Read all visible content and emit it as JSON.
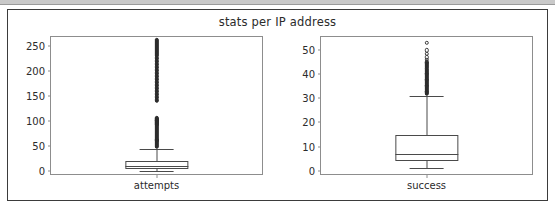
{
  "figure": {
    "title": "stats per IP address",
    "background": "#ffffff",
    "frame_color": "#3b3b3b",
    "axis_color": "#8d8d8d",
    "artist_color": "#4a4a4a"
  },
  "chart_data": [
    {
      "type": "box",
      "name": "attempts",
      "title": "stats per IP address",
      "xlabel": "",
      "ylabel": "",
      "categories": [
        "attempts"
      ],
      "xticklabels": [
        "attempts"
      ],
      "yticks": [
        0,
        50,
        100,
        150,
        200,
        250
      ],
      "yticklabels": [
        "0",
        "50",
        "100",
        "150",
        "200",
        "250"
      ],
      "ylim": [
        -6,
        268
      ],
      "grid": false,
      "legend": null,
      "stats": {
        "whisker_low": 1,
        "q1": 5,
        "median": 10,
        "q3": 20,
        "whisker_high": 45
      },
      "fliers": [
        48,
        50,
        52,
        55,
        57,
        58,
        60,
        61,
        62,
        63,
        65,
        66,
        68,
        70,
        72,
        74,
        76,
        78,
        80,
        82,
        84,
        86,
        88,
        90,
        92,
        93,
        94,
        95,
        96,
        97,
        98,
        99,
        100,
        100,
        101,
        102,
        103,
        104,
        105,
        106,
        140,
        143,
        146,
        149,
        152,
        155,
        158,
        161,
        164,
        167,
        170,
        173,
        176,
        179,
        182,
        185,
        188,
        191,
        194,
        197,
        200,
        203,
        206,
        209,
        212,
        215,
        218,
        221,
        224,
        227,
        230,
        232,
        234,
        236,
        238,
        240,
        242,
        244,
        246,
        248,
        250,
        252,
        254,
        256,
        258,
        260,
        262
      ]
    },
    {
      "type": "box",
      "name": "success",
      "title": "stats per IP address",
      "xlabel": "",
      "ylabel": "",
      "categories": [
        "success"
      ],
      "xticklabels": [
        "success"
      ],
      "yticks": [
        0,
        10,
        20,
        30,
        40,
        50
      ],
      "yticklabels": [
        "0",
        "10",
        "20",
        "30",
        "40",
        "50"
      ],
      "ylim": [
        -1.4,
        55.5
      ],
      "grid": false,
      "legend": null,
      "stats": {
        "whisker_low": 1,
        "q1": 4,
        "median": 7,
        "q3": 15,
        "whisker_high": 31
      },
      "fliers": [
        32,
        32.5,
        33,
        33.5,
        34,
        34.5,
        35,
        35.5,
        36,
        36.5,
        37,
        37.5,
        38,
        38.5,
        39,
        39.5,
        40,
        40.5,
        41,
        41.5,
        42,
        42.5,
        43,
        43.5,
        44,
        44.5,
        45,
        46,
        47,
        48.5,
        50,
        53
      ]
    }
  ]
}
